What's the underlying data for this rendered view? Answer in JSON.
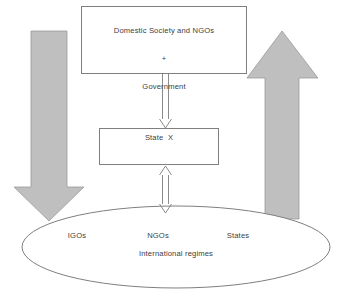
{
  "diagram": {
    "type": "flow-diagram",
    "colors": {
      "arrow_fill": "#bfbfbf",
      "arrow_stroke": "#8c8c8c",
      "box_stroke": "#7f7f7f",
      "text": "#404040",
      "background": "#ffffff"
    },
    "nodes": {
      "top_box": {
        "shape": "rectangle",
        "line1": "Domestic Society and NGOs",
        "line2": "+",
        "line3": "Government"
      },
      "state_box": {
        "shape": "rectangle",
        "label": "State  X"
      },
      "regimes_ellipse": {
        "shape": "ellipse",
        "title": "International regimes",
        "members": [
          {
            "label": "IGOs"
          },
          {
            "label": "NGOs"
          },
          {
            "label": "States"
          }
        ]
      }
    },
    "connectors": [
      {
        "name": "top-box-to-state-box",
        "style": "hollow-line-arrow",
        "direction": "down",
        "heads": 1
      },
      {
        "name": "state-box-to-regimes",
        "style": "hollow-line-arrow",
        "direction": "both",
        "heads": 2
      },
      {
        "name": "left-block-arrow",
        "style": "solid-block-arrow",
        "direction": "down"
      },
      {
        "name": "right-block-arrow",
        "style": "solid-block-arrow",
        "direction": "up"
      }
    ]
  }
}
